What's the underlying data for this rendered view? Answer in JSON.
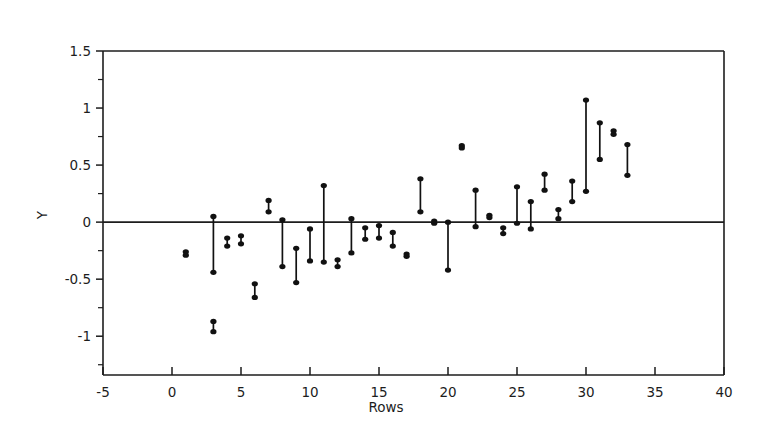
{
  "chart_data": {
    "type": "scatter",
    "title": "",
    "xlabel": "Rows",
    "ylabel": "Y",
    "xlim": [
      -5,
      40
    ],
    "ylim": [
      -1.34,
      1.5
    ],
    "grid": false,
    "legend": "none",
    "xticks": [
      -5,
      0,
      5,
      10,
      15,
      20,
      25,
      30,
      35,
      40
    ],
    "xtick_labels": [
      "-5",
      "0",
      "5",
      "10",
      "15",
      "20",
      "25",
      "30",
      "35",
      "40"
    ],
    "yticks": [
      -1,
      -0.5,
      0,
      0.5,
      1,
      1.5
    ],
    "ytick_labels": [
      "-1",
      "-0.5",
      "0",
      "0.5",
      "1",
      "1.5"
    ],
    "yminor_ticks": [
      -1.25,
      -0.75,
      -0.25,
      0.25,
      0.75,
      1.25
    ],
    "reference_line": 0,
    "series": [
      {
        "name": "range",
        "description": "Vertical interval per row with dot markers at the upper and lower limits",
        "points": [
          {
            "x": 1,
            "high": -0.26,
            "low": -0.29
          },
          {
            "x": 3,
            "high": 0.05,
            "low": -0.44
          },
          {
            "x": 3,
            "high": -0.87,
            "low": -0.96
          },
          {
            "x": 4,
            "high": -0.14,
            "low": -0.21
          },
          {
            "x": 5,
            "high": -0.12,
            "low": -0.19
          },
          {
            "x": 6,
            "high": -0.54,
            "low": -0.66
          },
          {
            "x": 7,
            "high": 0.19,
            "low": 0.09
          },
          {
            "x": 8,
            "high": 0.02,
            "low": -0.39
          },
          {
            "x": 9,
            "high": -0.23,
            "low": -0.53
          },
          {
            "x": 10,
            "high": -0.06,
            "low": -0.34
          },
          {
            "x": 11,
            "high": 0.32,
            "low": -0.35
          },
          {
            "x": 12,
            "high": -0.33,
            "low": -0.39
          },
          {
            "x": 13,
            "high": 0.03,
            "low": -0.27
          },
          {
            "x": 14,
            "high": -0.05,
            "low": -0.15
          },
          {
            "x": 15,
            "high": -0.03,
            "low": -0.14
          },
          {
            "x": 16,
            "high": -0.09,
            "low": -0.21
          },
          {
            "x": 17,
            "high": -0.28,
            "low": -0.3
          },
          {
            "x": 18,
            "high": 0.38,
            "low": 0.09
          },
          {
            "x": 19,
            "high": 0.01,
            "low": -0.01
          },
          {
            "x": 20,
            "high": 0.0,
            "low": -0.42
          },
          {
            "x": 21,
            "high": 0.67,
            "low": 0.65
          },
          {
            "x": 22,
            "high": 0.28,
            "low": -0.04
          },
          {
            "x": 23,
            "high": 0.06,
            "low": 0.04
          },
          {
            "x": 24,
            "high": -0.05,
            "low": -0.1
          },
          {
            "x": 25,
            "high": 0.31,
            "low": -0.01
          },
          {
            "x": 26,
            "high": 0.18,
            "low": -0.06
          },
          {
            "x": 27,
            "high": 0.42,
            "low": 0.28
          },
          {
            "x": 28,
            "high": 0.11,
            "low": 0.03
          },
          {
            "x": 29,
            "high": 0.36,
            "low": 0.18
          },
          {
            "x": 30,
            "high": 1.07,
            "low": 0.27
          },
          {
            "x": 31,
            "high": 0.87,
            "low": 0.55
          },
          {
            "x": 32,
            "high": 0.8,
            "low": 0.77
          },
          {
            "x": 33,
            "high": 0.68,
            "low": 0.41
          }
        ]
      }
    ]
  },
  "labels": {
    "x_axis_title": "Rows",
    "y_axis_title": "Y"
  }
}
